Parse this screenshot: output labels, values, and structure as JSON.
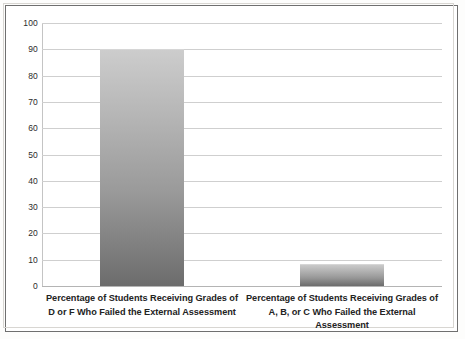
{
  "chart_data": {
    "type": "bar",
    "title": "",
    "subtitle": "",
    "xlabel": "",
    "ylabel": "",
    "ylim": [
      0,
      100
    ],
    "grid": true,
    "legend": false,
    "legend_position": "none",
    "categories": [
      "Percentage of Students Receiving Grades of D or F Who Failed the External Assessment",
      "Percentage of Students Receiving Grades of A, B, or C Who Failed the External Assessment"
    ],
    "category_lines": [
      [
        "Percentage of Students Receiving Grades of",
        "D or F Who Failed the External Assessment"
      ],
      [
        "Percentage of Students Receiving Grades of",
        "A, B, or C Who Failed the External Assessment"
      ]
    ],
    "values": [
      90,
      8.5
    ],
    "yticks": [
      100,
      90,
      80,
      70,
      60,
      50,
      40,
      30,
      20,
      10,
      0
    ],
    "bar_color_top": "#cdcdcd",
    "bar_color_bottom": "#6c6c6c",
    "gridline_color": "#cfcfcf",
    "axis_color": "#b4b4b4",
    "text_color": "#232323",
    "background_color": "#ffffff",
    "frame_color": "#6f6f6f"
  }
}
